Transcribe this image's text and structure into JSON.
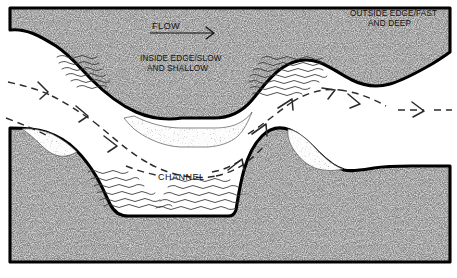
{
  "figure": {
    "labels": {
      "flow": "FLOW",
      "inside_edge_line1": "INSIDE EDGE/SLOW",
      "inside_edge_line2": "AND SHALLOW",
      "outside_edge_line1": "OUTSIDE EDGE/FAST",
      "outside_edge_line2": "AND DEEP",
      "channel": "CHANNEL"
    },
    "colors": {
      "background": "#ffffff",
      "bank_fill": "#b9b9b9",
      "bank_stipple": "#3a3a3a",
      "shoreline": "#000000",
      "point_bar_fill": "#fbfbfb",
      "point_bar_stipple": "#4a4a4a",
      "water": "#ffffff",
      "ripple_line": "#333333",
      "flow_arrow": "#2b2b2b",
      "text": "#111111"
    },
    "icons": {
      "flow_arrow": "arrow-right-icon",
      "current_arrow": "dashed-flow-arrow-icon"
    },
    "elements": {
      "upper_bank": "upper-stippled-bank",
      "lower_bank": "lower-stippled-bank",
      "point_bar_upper": "upper-point-bar-deposit",
      "point_bar_lower_left": "lower-left-point-bar-deposit",
      "point_bar_lower_right": "lower-right-point-bar-deposit",
      "shallow_ripples": "shallow-water-ripple-hatching",
      "channel_flow": "channel-current-lines"
    }
  }
}
